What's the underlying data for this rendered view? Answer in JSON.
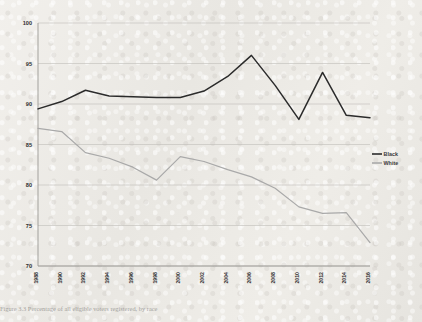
{
  "page": {
    "background_color": "#eceae6",
    "caption": "Figure 3.3  Percentage of all eligible voters registered, by race"
  },
  "legend": {
    "position": "right-middle",
    "entries": [
      {
        "label": "Black",
        "color": "#2b2b2b"
      },
      {
        "label": "White",
        "color": "#a9a9a9"
      }
    ]
  },
  "chart_data": {
    "type": "line",
    "title": "",
    "xlabel": "",
    "ylabel": "",
    "ylim": [
      70,
      100
    ],
    "yticks": [
      70,
      75,
      80,
      85,
      90,
      95,
      100
    ],
    "grid": true,
    "x": [
      1988,
      1990,
      1992,
      1994,
      1996,
      1998,
      2000,
      2002,
      2004,
      2006,
      2008,
      2010,
      2012,
      2014,
      2016
    ],
    "categories": [
      "1988",
      "1990",
      "1992",
      "1994",
      "1996",
      "1998",
      "2000",
      "2002",
      "2004",
      "2006",
      "2008",
      "2010",
      "2012",
      "2014",
      "2016"
    ],
    "series": [
      {
        "name": "Black",
        "color": "#2b2b2b",
        "values": [
          89.4,
          90.3,
          91.7,
          91.0,
          90.9,
          90.8,
          90.8,
          91.6,
          93.4,
          96.0,
          92.3,
          88.1,
          93.9,
          88.6,
          88.3
        ]
      },
      {
        "name": "White",
        "color": "#a9a9a9",
        "values": [
          87.0,
          86.6,
          84.0,
          83.3,
          82.2,
          80.6,
          83.5,
          82.9,
          81.9,
          81.0,
          79.6,
          77.3,
          76.5,
          76.6,
          72.9
        ]
      }
    ]
  }
}
